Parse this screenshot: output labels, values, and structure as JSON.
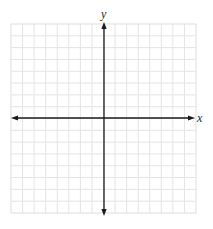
{
  "diagram": {
    "type": "cartesian-coordinate-grid",
    "grid": {
      "columns": 16,
      "rows": 16,
      "left": 11,
      "top": 24,
      "right": 196,
      "bottom": 213,
      "line_color": "#e4e4e4",
      "border_color": "#dddddd"
    },
    "axes": {
      "color": "#1a1a1a",
      "origin": {
        "x": 104,
        "y": 118
      },
      "x_axis": {
        "label": "x",
        "start": 11,
        "end": 195,
        "arrows": "both"
      },
      "y_axis": {
        "label": "y",
        "start": 22,
        "end": 216,
        "arrows": "both"
      }
    },
    "background": "#ffffff"
  },
  "chart_data": {
    "type": "table",
    "title": "",
    "xlabel": "x",
    "ylabel": "y",
    "grid": true,
    "grid_cells": {
      "columns": 16,
      "rows": 16
    },
    "xlim": [
      -8,
      8
    ],
    "ylim": [
      -8,
      8
    ],
    "series": []
  }
}
